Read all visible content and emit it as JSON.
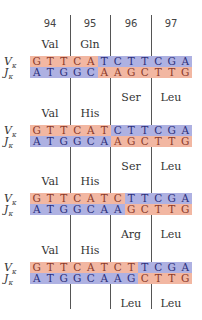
{
  "colors": {
    "salmon": "#f2b7a2",
    "blue": "#aeb1e2",
    "line": "#555555"
  },
  "codon_numbers": [
    "94",
    "95",
    "96",
    "97"
  ],
  "row_labels": {
    "v": "V",
    "j": "J",
    "subscript": "κ"
  },
  "blocks": [
    {
      "top_labels": [
        "Val",
        "Gln",
        "",
        ""
      ],
      "v_seq": [
        "G",
        "T",
        "T",
        "C",
        "A",
        "T",
        "C",
        "T",
        "T",
        "C",
        "G",
        "A"
      ],
      "v_switch": 5,
      "j_seq": [
        "A",
        "T",
        "G",
        "G",
        "C",
        "A",
        "A",
        "G",
        "C",
        "T",
        "T",
        "G"
      ],
      "j_switch": 5,
      "bottom_labels": [
        "",
        "",
        "Ser",
        "Leu"
      ]
    },
    {
      "top_labels": [
        "Val",
        "His",
        "",
        ""
      ],
      "v_seq": [
        "G",
        "T",
        "T",
        "C",
        "A",
        "T",
        "C",
        "T",
        "T",
        "C",
        "G",
        "A"
      ],
      "v_switch": 6,
      "j_seq": [
        "A",
        "T",
        "G",
        "G",
        "C",
        "A",
        "A",
        "G",
        "C",
        "T",
        "T",
        "G"
      ],
      "j_switch": 6,
      "bottom_labels": [
        "",
        "",
        "Ser",
        "Leu"
      ]
    },
    {
      "top_labels": [
        "Val",
        "His",
        "",
        ""
      ],
      "v_seq": [
        "G",
        "T",
        "T",
        "C",
        "A",
        "T",
        "C",
        "T",
        "T",
        "C",
        "G",
        "A"
      ],
      "v_switch": 7,
      "j_seq": [
        "A",
        "T",
        "G",
        "G",
        "C",
        "A",
        "A",
        "G",
        "C",
        "T",
        "T",
        "G"
      ],
      "j_switch": 7,
      "bottom_labels": [
        "",
        "",
        "Arg",
        "Leu"
      ]
    },
    {
      "top_labels": [
        "Val",
        "His",
        "",
        ""
      ],
      "v_seq": [
        "G",
        "T",
        "T",
        "C",
        "A",
        "T",
        "C",
        "T",
        "T",
        "C",
        "G",
        "A"
      ],
      "v_switch": 8,
      "j_seq": [
        "A",
        "T",
        "G",
        "G",
        "C",
        "A",
        "A",
        "G",
        "C",
        "T",
        "T",
        "G"
      ],
      "j_switch": 8,
      "bottom_labels": [
        "",
        "",
        "Leu",
        "Leu"
      ]
    }
  ]
}
